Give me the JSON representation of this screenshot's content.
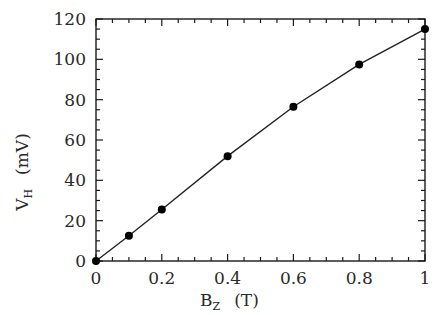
{
  "chart_data": {
    "type": "line",
    "title": "",
    "xlabel": "B_Z (T)",
    "ylabel": "V_H (mV)",
    "xlabel_main": "B",
    "xlabel_sub": "Z",
    "xlabel_unit": "(T)",
    "ylabel_main": "V",
    "ylabel_sub": "H",
    "ylabel_unit": "(mV)",
    "xlim": [
      0,
      1
    ],
    "ylim": [
      0,
      120
    ],
    "x_ticks": [
      "0",
      "0.2",
      "0.4",
      "0.6",
      "0.8",
      "1"
    ],
    "y_ticks": [
      "0",
      "20",
      "40",
      "60",
      "80",
      "100",
      "120"
    ],
    "grid": false,
    "legend": null,
    "series": [
      {
        "name": "V_H vs B_Z",
        "marker": "filled-circle",
        "line": "solid",
        "x": [
          0,
          0.1,
          0.2,
          0.4,
          0.6,
          0.8,
          1.0
        ],
        "y": [
          0,
          12.5,
          25.5,
          52,
          76.5,
          97.5,
          115
        ]
      }
    ]
  }
}
